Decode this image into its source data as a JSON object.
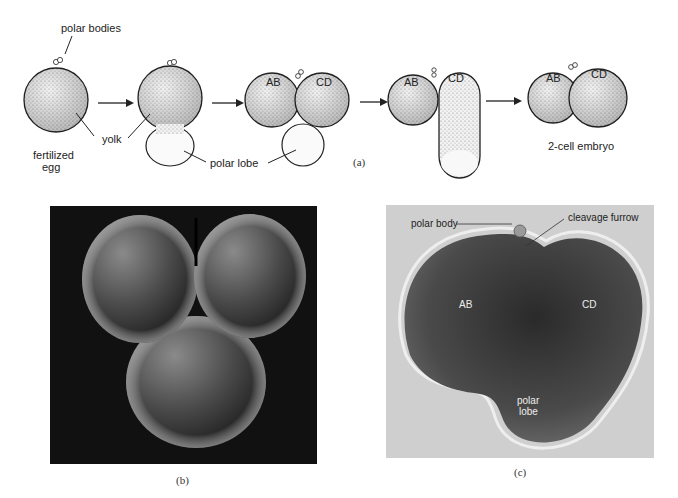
{
  "figure": {
    "panel_a": {
      "caption": "(a)",
      "labels": {
        "polar_bodies": "polar bodies",
        "yolk": "yolk",
        "fertilized_egg_line1": "fertilized",
        "fertilized_egg_line2": "egg",
        "polar_lobe": "polar lobe",
        "stage3_ab": "AB",
        "stage3_cd": "CD",
        "stage4_ab": "AB",
        "stage4_cd": "CD",
        "stage5_ab": "AB",
        "stage5_cd": "CD",
        "two_cell_embryo": "2-cell embryo"
      },
      "stages": [
        "fertilized egg",
        "polar lobe formation",
        "first cleavage with polar lobe",
        "polar lobe fused into CD",
        "2-cell embryo"
      ]
    },
    "panel_b": {
      "caption": "(b)",
      "description": "scanning electron micrograph of embryo with polar lobe"
    },
    "panel_c": {
      "caption": "(c)",
      "labels": {
        "polar_body": "polar body",
        "cleavage_furrow": "cleavage furrow",
        "ab": "AB",
        "cd": "CD",
        "polar_lobe_line1": "polar",
        "polar_lobe_line2": "lobe"
      }
    },
    "colors": {
      "line": "#222222",
      "stipple": "#9a9a9a",
      "sem_background": "#111111",
      "micrograph_background": "#cfcfcf"
    }
  }
}
